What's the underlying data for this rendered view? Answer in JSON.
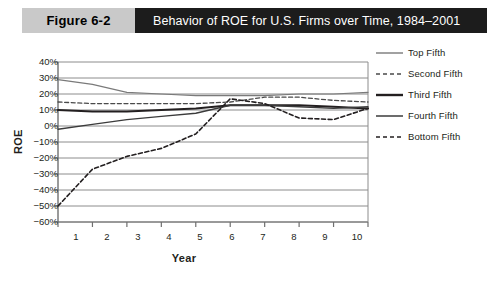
{
  "header": {
    "figure_tag": "Figure 6-2",
    "title": "Behavior of ROE for U.S. Firms over Time, 1984–2001"
  },
  "colors": {
    "band_background": "#1c1c1c",
    "tag_background": "#c9c9c9",
    "tag_text": "#000000",
    "title_text": "#ffffff",
    "gridline": "#8c8c8c",
    "axis": "#6f6f6f",
    "series_dark": "#231f20",
    "series_mid": "#4a4a4a",
    "series_light": "#7a7a7a",
    "page_background": "#ffffff"
  },
  "chart_data": {
    "type": "line",
    "title": "Behavior of ROE for U.S. Firms over Time, 1984–2001",
    "xlabel": "Year",
    "ylabel": "ROE",
    "x": [
      1,
      2,
      3,
      4,
      5,
      6,
      7,
      8,
      9,
      10
    ],
    "xlim": [
      1,
      10
    ],
    "ylim": [
      -60,
      40
    ],
    "ytick_labels": [
      "40%",
      "30%",
      "20%",
      "10%",
      "0%",
      "−10%",
      "−20%",
      "−30%",
      "−40%",
      "−50%",
      "−60%"
    ],
    "ytick_values": [
      40,
      30,
      20,
      10,
      0,
      -10,
      -20,
      -30,
      -40,
      -50,
      -60
    ],
    "xtick_labels": [
      "1",
      "2",
      "3",
      "4",
      "5",
      "6",
      "7",
      "8",
      "9",
      "10"
    ],
    "grid": true,
    "legend_position": "right",
    "series": [
      {
        "name": "Top Fifth",
        "style": "solid",
        "width": 1.2,
        "color": "#7a7a7a",
        "values": [
          29,
          26,
          21,
          20,
          19,
          19,
          19,
          20,
          20,
          21
        ]
      },
      {
        "name": "Second Fifth",
        "style": "dashed",
        "width": 1.3,
        "color": "#4a4a4a",
        "values": [
          15,
          14,
          14,
          14,
          14,
          15,
          18,
          18,
          16,
          15
        ]
      },
      {
        "name": "Third Fifth",
        "style": "solid",
        "width": 2.0,
        "color": "#231f20",
        "values": [
          10,
          9,
          9,
          10,
          11,
          13,
          13,
          13,
          12,
          11
        ]
      },
      {
        "name": "Fourth Fifth",
        "style": "solid",
        "width": 1.4,
        "color": "#3b3b3b",
        "values": [
          -2,
          1,
          4,
          6,
          8,
          13,
          13,
          12,
          11,
          12
        ]
      },
      {
        "name": "Bottom Fifth",
        "style": "dashed",
        "width": 1.6,
        "color": "#231f20",
        "values": [
          -50,
          -27,
          -19,
          -14,
          -5,
          17,
          14,
          5,
          4,
          11
        ]
      }
    ]
  },
  "legend": {
    "items": [
      {
        "label": "Top Fifth",
        "style": "solid"
      },
      {
        "label": "Second Fifth",
        "style": "dashed"
      },
      {
        "label": "Third Fifth",
        "style": "solid-thick"
      },
      {
        "label": "Fourth Fifth",
        "style": "solid"
      },
      {
        "label": "Bottom Fifth",
        "style": "dashed"
      }
    ]
  }
}
